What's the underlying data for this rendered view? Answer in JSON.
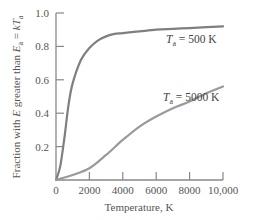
{
  "chart_data": {
    "type": "line",
    "title": "",
    "xlabel": "Temperature, K",
    "ylabel": {
      "prefix": "Fraction with ",
      "var_E": "E",
      "middle": " greater than ",
      "var_Ea": "E",
      "sub_a": "a",
      "eq": " = ",
      "var_k": "kT",
      "sub_a2": "a"
    },
    "xlim": [
      0,
      10000
    ],
    "ylim": [
      0,
      1.0
    ],
    "x_ticks": [
      0,
      2000,
      4000,
      6000,
      8000,
      10000
    ],
    "x_tick_labels": [
      "0",
      "2000",
      "4000",
      "6000",
      "8000",
      "10,000"
    ],
    "y_ticks": [
      0.2,
      0.4,
      0.6,
      0.8,
      1.0
    ],
    "y_tick_labels": [
      "0.2",
      "0.4",
      "0.6",
      "0.8",
      "1.0"
    ],
    "grid": false,
    "series": [
      {
        "name": "Ta = 500 K",
        "label_T": "T",
        "label_sub": "a",
        "label_rest": " = 500 K",
        "color": "#7f7f7f",
        "x": [
          0,
          250,
          500,
          750,
          1000,
          1500,
          2000,
          2500,
          3000,
          3500,
          4000,
          5000,
          6000,
          7000,
          8000,
          9000,
          10000
        ],
        "values": [
          0,
          0.08,
          0.25,
          0.45,
          0.58,
          0.72,
          0.79,
          0.835,
          0.86,
          0.875,
          0.88,
          0.89,
          0.9,
          0.905,
          0.91,
          0.915,
          0.92
        ]
      },
      {
        "name": "Ta = 5000 K",
        "label_T": "T",
        "label_sub": "a",
        "label_rest": " = 5000 K",
        "color": "#9a9a9a",
        "x": [
          0,
          1000,
          2000,
          3000,
          4000,
          5000,
          6000,
          7000,
          8000,
          9000,
          10000
        ],
        "values": [
          0,
          0.03,
          0.07,
          0.15,
          0.24,
          0.32,
          0.38,
          0.43,
          0.47,
          0.52,
          0.56
        ]
      }
    ]
  }
}
